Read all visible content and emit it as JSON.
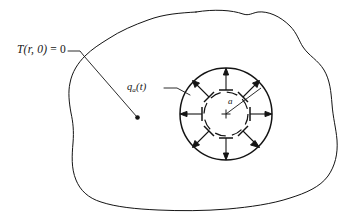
{
  "figure": {
    "domain_title": "Transient heat conduction in a body with a circular cavity",
    "width": 364,
    "height": 222,
    "background_color": "#ffffff",
    "stroke_color": "#141414"
  },
  "labels": {
    "initial_condition": {
      "name": "initial-condition-label",
      "symbol": "T",
      "args": "(r, 0)",
      "equals": " = ",
      "value": "0",
      "full_text": "T(r,0) = 0",
      "meaning": "initial temperature field is zero"
    },
    "flux": {
      "name": "surface-flux-label",
      "symbol": "q",
      "subscript": "a",
      "args": "(t)",
      "full_text": "qa(t)",
      "meaning": "time dependent heat flux applied at cavity surface r = a"
    },
    "radius": {
      "name": "radius-label",
      "text": "a",
      "meaning": "radius of the circular cavity"
    }
  },
  "geometry": {
    "outer_body": {
      "name": "irregular-body-outline",
      "description": "closed irregular freehand blob representing a two dimensional solid body",
      "line_style": "solid",
      "stroke_width": 1.0
    },
    "cavity_outer_circle": {
      "name": "cavity-boundary-circle",
      "center_x": 226,
      "center_y": 114,
      "radius": 46,
      "line_style": "solid",
      "stroke_width": 1.4
    },
    "inner_dashed_circle": {
      "name": "inner-dashed-circle",
      "center_x": 226,
      "center_y": 114,
      "radius": 22,
      "line_style": "dashed",
      "segments": 8,
      "stroke_width": 1.2
    },
    "center_mark": {
      "name": "center-cross-mark",
      "x": 226,
      "y": 114,
      "size": 6
    },
    "radius_line": {
      "name": "radius-leader-line",
      "from_x": 226,
      "from_y": 114,
      "to_x": 262,
      "to_y": 88
    },
    "flux_arrows": {
      "name": "radial-flux-arrows",
      "count": 8,
      "direction": "outward",
      "inner_radius": 24,
      "outer_radius": 46,
      "angles_deg": [
        0,
        45,
        90,
        135,
        180,
        225,
        270,
        315
      ]
    },
    "initial_condition_leader": {
      "name": "initial-condition-leader-line",
      "start_x": 68,
      "start_y": 51,
      "bend_x": 82,
      "bend_y": 57,
      "end_x": 137,
      "end_y": 117,
      "end_dot_radius": 2.2
    },
    "flux_leader": {
      "name": "flux-leader-line",
      "start_x": 164,
      "start_y": 88,
      "end_x": 188,
      "end_y": 88
    }
  },
  "icons": {
    "arrow_head": "arrow-head-icon",
    "cross_mark": "cross-mark-icon",
    "leader_dot": "leader-dot-icon"
  }
}
